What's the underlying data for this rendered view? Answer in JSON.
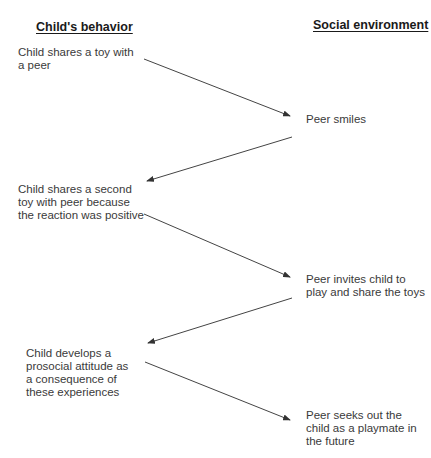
{
  "headers": {
    "left": "Child's behavior",
    "right": "Social environment"
  },
  "child_steps": [
    {
      "text": "Child shares a toy with a peer"
    },
    {
      "text": "Child shares a second toy with peer because the reaction was positive"
    },
    {
      "text": "Child develops a prosocial attitude as a consequence of these experiences"
    }
  ],
  "environment_steps": [
    {
      "text": "Peer smiles"
    },
    {
      "text": "Peer invites child to play and share the toys"
    },
    {
      "text": "Peer seeks out the child as a playmate in the future"
    }
  ],
  "arrows": [
    {
      "from": "child_steps.0",
      "to": "environment_steps.0"
    },
    {
      "from": "environment_steps.0",
      "to": "child_steps.1"
    },
    {
      "from": "child_steps.1",
      "to": "environment_steps.1"
    },
    {
      "from": "environment_steps.1",
      "to": "child_steps.2"
    },
    {
      "from": "child_steps.2",
      "to": "environment_steps.2"
    }
  ],
  "colors": {
    "text": "#3a3a3a",
    "header": "#1a1a1a",
    "arrow": "#444444"
  }
}
